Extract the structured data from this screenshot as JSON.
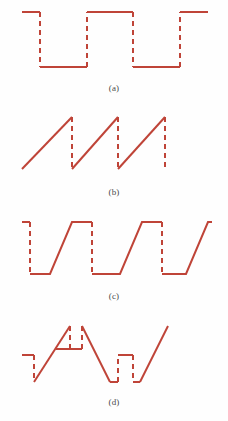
{
  "figure": {
    "title": "",
    "stroke_color": "#bf4438",
    "background_color": "#fefefe",
    "caption_color": "#4a4a4a",
    "stroke_width": 2,
    "dash_pattern": "5,4",
    "panels": [
      {
        "id": "a",
        "caption": "(a)",
        "description": "square wave with dashed vertical transitions",
        "viewbox": "0 0 228 82",
        "solid_segments": [
          "M 22,12 L 40,12",
          "M 40,67 L 87,67",
          "M 87,12 L 133,12",
          "M 133,67 L 180,67",
          "M 180,12 L 208,12"
        ],
        "dashed_segments": [
          "M 40,12 L 40,67",
          "M 87,67 L 87,12",
          "M 133,12 L 133,67",
          "M 180,67 L 180,12"
        ]
      },
      {
        "id": "b",
        "caption": "(b)",
        "description": "sawtooth wave with dashed vertical flybacks",
        "viewbox": "0 0 228 80",
        "solid_segments": [
          "M 22,63 L 72,11",
          "M 72,63 L 118,11",
          "M 118,63 L 165,11"
        ],
        "dashed_segments": [
          "M 72,11 L 72,63",
          "M 118,11 L 118,63",
          "M 165,11 L 165,63"
        ]
      },
      {
        "id": "c",
        "caption": "(c)",
        "description": "trapezoidal wave: dashed vertical falls, sloped rises",
        "viewbox": "0 0 228 80",
        "solid_segments": [
          "M 22,12 L 30,12",
          "M 30,64 L 50,64 L 72,12 L 92,12",
          "M 92,64 L 120,64 L 142,12 L 162,12",
          "M 162,64 L 186,64 L 208,12 L 212,12"
        ],
        "dashed_segments": [
          "M 30,12 L 30,64",
          "M 92,12 L 92,64",
          "M 162,12 L 162,64"
        ]
      },
      {
        "id": "d",
        "caption": "(d)",
        "description": "triangular wave with dashed notch pulses at the peaks and troughs",
        "viewbox": "0 0 228 82",
        "solid_segments": [
          "M 22,41 L 34,41",
          "M 34,68 L 70,12",
          "M 56,35 L 70,35",
          "M 70,35 L 82,35",
          "M 82,12 L 110,68",
          "M 110,68 L 118,68",
          "M 118,41 L 133,41",
          "M 133,68 L 140,68",
          "M 140,68 L 168,12"
        ],
        "dashed_segments": [
          "M 34,41 L 34,68",
          "M 70,12 L 70,35",
          "M 82,35 L 82,12",
          "M 118,68 L 118,41",
          "M 133,41 L 133,68"
        ]
      }
    ]
  }
}
